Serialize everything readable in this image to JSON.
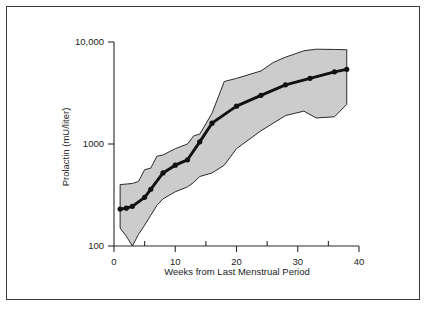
{
  "chart_data": {
    "type": "line",
    "title": "",
    "xlabel": "Weeks from Last Menstrual Period",
    "ylabel": "Prolactin (mU/liter)",
    "yscale": "log",
    "xlim": [
      0,
      40
    ],
    "ylim": [
      100,
      10000
    ],
    "grid": false,
    "legend": null,
    "x_ticks": [
      0,
      10,
      20,
      30,
      40
    ],
    "x_tick_labels": [
      "0",
      "10",
      "20",
      "30",
      "40"
    ],
    "x_minor_ticks": [
      5,
      15,
      25,
      35
    ],
    "y_ticks": [
      100,
      1000,
      10000
    ],
    "y_tick_labels": [
      "100",
      "1000",
      "10,000"
    ],
    "series": [
      {
        "name": "Median prolactin",
        "marker": "filled-circle",
        "x": [
          1,
          2,
          3,
          5,
          6,
          8,
          10,
          12,
          14,
          16,
          20,
          24,
          28,
          32,
          36,
          38
        ],
        "values": [
          230,
          235,
          245,
          300,
          360,
          520,
          620,
          700,
          1050,
          1600,
          2350,
          3000,
          3800,
          4400,
          5100,
          5400
        ]
      }
    ],
    "band": {
      "name": "Reference range",
      "x": [
        1,
        2,
        3,
        4,
        5,
        6,
        7,
        8,
        10,
        12,
        13,
        14,
        16,
        18,
        20,
        24,
        26,
        28,
        31,
        33,
        36,
        38
      ],
      "upper": [
        400,
        405,
        410,
        430,
        560,
        580,
        760,
        780,
        900,
        1000,
        1200,
        1250,
        2000,
        4100,
        4400,
        5200,
        6300,
        7100,
        8200,
        8500,
        8450,
        8400
      ],
      "lower": [
        150,
        125,
        100,
        130,
        160,
        200,
        250,
        290,
        340,
        380,
        420,
        480,
        520,
        620,
        900,
        1350,
        1600,
        1900,
        2100,
        1800,
        1850,
        2450
      ]
    }
  },
  "axis_titles": {
    "x": "Weeks from Last Menstrual Period",
    "y": "Prolactin (mU/liter)"
  }
}
